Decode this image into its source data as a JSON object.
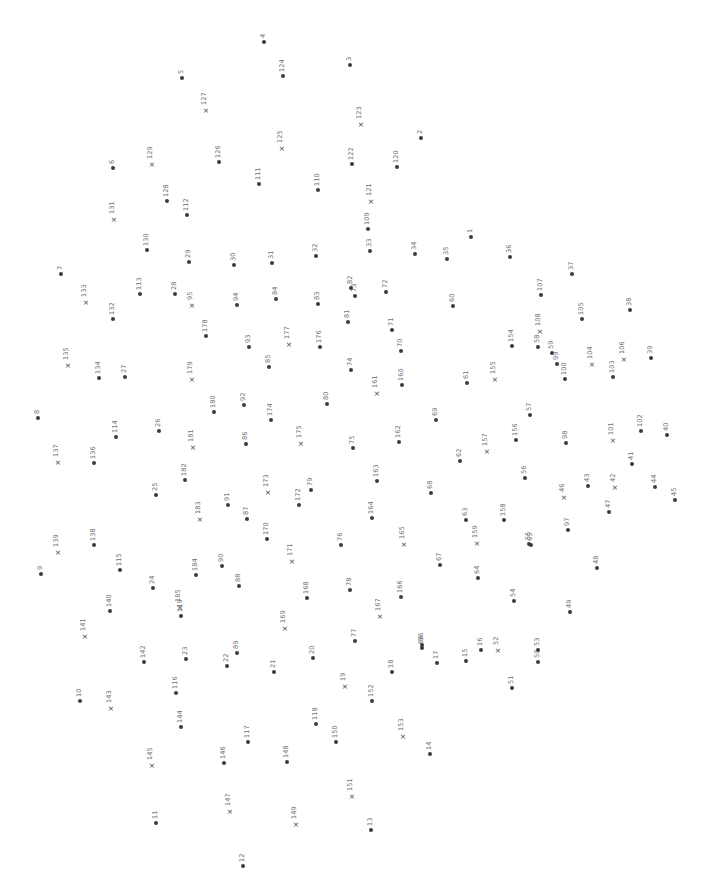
{
  "meta": {
    "width": 719,
    "height": 884,
    "background_color": "#ffffff",
    "marker_color": "#3a3a42",
    "label_color": "#6f6f79",
    "label_rotation_deg": -90,
    "dot_marker": "filled-circle",
    "cross_marker": "×"
  },
  "chart_data": {
    "type": "scatter",
    "title": "",
    "xlabel": "",
    "ylabel": "",
    "grid": false,
    "legend": "none",
    "xlim": [
      0,
      719
    ],
    "ylim": [
      0,
      884
    ],
    "marker_kinds": [
      "dot",
      "cross"
    ],
    "point_count": 185,
    "points": [
      {
        "label": "1",
        "x": 471,
        "y": 237,
        "marker": "dot"
      },
      {
        "label": "2",
        "x": 421,
        "y": 138,
        "marker": "dot"
      },
      {
        "label": "3",
        "x": 350,
        "y": 65,
        "marker": "dot"
      },
      {
        "label": "4",
        "x": 264,
        "y": 42,
        "marker": "dot"
      },
      {
        "label": "5",
        "x": 182,
        "y": 78,
        "marker": "dot"
      },
      {
        "label": "6",
        "x": 113,
        "y": 168,
        "marker": "dot"
      },
      {
        "label": "7",
        "x": 61,
        "y": 274,
        "marker": "dot"
      },
      {
        "label": "8",
        "x": 38,
        "y": 418,
        "marker": "dot"
      },
      {
        "label": "9",
        "x": 41,
        "y": 574,
        "marker": "dot"
      },
      {
        "label": "10",
        "x": 80,
        "y": 701,
        "marker": "dot"
      },
      {
        "label": "11",
        "x": 156,
        "y": 823,
        "marker": "dot"
      },
      {
        "label": "12",
        "x": 243,
        "y": 866,
        "marker": "dot"
      },
      {
        "label": "13",
        "x": 371,
        "y": 830,
        "marker": "dot"
      },
      {
        "label": "14",
        "x": 430,
        "y": 754,
        "marker": "dot"
      },
      {
        "label": "15",
        "x": 466,
        "y": 661,
        "marker": "dot"
      },
      {
        "label": "16",
        "x": 481,
        "y": 650,
        "marker": "dot"
      },
      {
        "label": "17",
        "x": 437,
        "y": 663,
        "marker": "dot"
      },
      {
        "label": "18",
        "x": 392,
        "y": 672,
        "marker": "dot"
      },
      {
        "label": "19",
        "x": 345,
        "y": 686,
        "marker": "cross"
      },
      {
        "label": "20",
        "x": 313,
        "y": 658,
        "marker": "dot"
      },
      {
        "label": "21",
        "x": 274,
        "y": 672,
        "marker": "dot"
      },
      {
        "label": "22",
        "x": 227,
        "y": 666,
        "marker": "dot"
      },
      {
        "label": "23",
        "x": 186,
        "y": 659,
        "marker": "dot"
      },
      {
        "label": "24",
        "x": 153,
        "y": 588,
        "marker": "dot"
      },
      {
        "label": "25",
        "x": 156,
        "y": 495,
        "marker": "dot"
      },
      {
        "label": "26",
        "x": 159,
        "y": 431,
        "marker": "dot"
      },
      {
        "label": "27",
        "x": 125,
        "y": 377,
        "marker": "dot"
      },
      {
        "label": "28",
        "x": 175,
        "y": 294,
        "marker": "dot"
      },
      {
        "label": "29",
        "x": 189,
        "y": 262,
        "marker": "dot"
      },
      {
        "label": "30",
        "x": 234,
        "y": 265,
        "marker": "dot"
      },
      {
        "label": "31",
        "x": 272,
        "y": 263,
        "marker": "dot"
      },
      {
        "label": "32",
        "x": 316,
        "y": 256,
        "marker": "dot"
      },
      {
        "label": "33",
        "x": 370,
        "y": 251,
        "marker": "dot"
      },
      {
        "label": "34",
        "x": 415,
        "y": 254,
        "marker": "dot"
      },
      {
        "label": "35",
        "x": 447,
        "y": 259,
        "marker": "dot"
      },
      {
        "label": "36",
        "x": 510,
        "y": 257,
        "marker": "dot"
      },
      {
        "label": "37",
        "x": 572,
        "y": 274,
        "marker": "dot"
      },
      {
        "label": "38",
        "x": 630,
        "y": 310,
        "marker": "dot"
      },
      {
        "label": "39",
        "x": 651,
        "y": 358,
        "marker": "dot"
      },
      {
        "label": "40",
        "x": 667,
        "y": 435,
        "marker": "dot"
      },
      {
        "label": "41",
        "x": 632,
        "y": 464,
        "marker": "dot"
      },
      {
        "label": "42",
        "x": 615,
        "y": 487,
        "marker": "cross"
      },
      {
        "label": "43",
        "x": 588,
        "y": 486,
        "marker": "dot"
      },
      {
        "label": "44",
        "x": 655,
        "y": 487,
        "marker": "dot"
      },
      {
        "label": "45",
        "x": 675,
        "y": 500,
        "marker": "dot"
      },
      {
        "label": "46",
        "x": 564,
        "y": 497,
        "marker": "cross"
      },
      {
        "label": "47",
        "x": 609,
        "y": 512,
        "marker": "dot"
      },
      {
        "label": "48",
        "x": 597,
        "y": 568,
        "marker": "dot"
      },
      {
        "label": "49",
        "x": 570,
        "y": 612,
        "marker": "dot"
      },
      {
        "label": "50",
        "x": 538,
        "y": 662,
        "marker": "dot"
      },
      {
        "label": "51",
        "x": 512,
        "y": 688,
        "marker": "dot"
      },
      {
        "label": "52",
        "x": 498,
        "y": 650,
        "marker": "cross"
      },
      {
        "label": "53",
        "x": 538,
        "y": 650,
        "marker": "dot"
      },
      {
        "label": "54",
        "x": 514,
        "y": 601,
        "marker": "dot"
      },
      {
        "label": "55",
        "x": 529,
        "y": 544,
        "marker": "dot"
      },
      {
        "label": "56",
        "x": 525,
        "y": 478,
        "marker": "dot"
      },
      {
        "label": "57",
        "x": 530,
        "y": 415,
        "marker": "dot"
      },
      {
        "label": "58",
        "x": 538,
        "y": 347,
        "marker": "dot"
      },
      {
        "label": "59",
        "x": 552,
        "y": 353,
        "marker": "dot"
      },
      {
        "label": "60",
        "x": 453,
        "y": 306,
        "marker": "dot"
      },
      {
        "label": "61",
        "x": 467,
        "y": 383,
        "marker": "dot"
      },
      {
        "label": "62",
        "x": 460,
        "y": 461,
        "marker": "dot"
      },
      {
        "label": "63",
        "x": 466,
        "y": 520,
        "marker": "dot"
      },
      {
        "label": "64",
        "x": 478,
        "y": 578,
        "marker": "dot"
      },
      {
        "label": "65",
        "x": 531,
        "y": 545,
        "marker": "dot"
      },
      {
        "label": "66",
        "x": 422,
        "y": 648,
        "marker": "dot"
      },
      {
        "label": "67",
        "x": 440,
        "y": 565,
        "marker": "dot"
      },
      {
        "label": "68",
        "x": 431,
        "y": 493,
        "marker": "dot"
      },
      {
        "label": "69",
        "x": 436,
        "y": 420,
        "marker": "dot"
      },
      {
        "label": "70",
        "x": 401,
        "y": 351,
        "marker": "dot"
      },
      {
        "label": "71",
        "x": 392,
        "y": 330,
        "marker": "dot"
      },
      {
        "label": "72",
        "x": 386,
        "y": 292,
        "marker": "dot"
      },
      {
        "label": "73",
        "x": 355,
        "y": 296,
        "marker": "dot"
      },
      {
        "label": "74",
        "x": 351,
        "y": 370,
        "marker": "dot"
      },
      {
        "label": "75",
        "x": 353,
        "y": 448,
        "marker": "dot"
      },
      {
        "label": "76",
        "x": 341,
        "y": 545,
        "marker": "dot"
      },
      {
        "label": "77",
        "x": 355,
        "y": 641,
        "marker": "dot"
      },
      {
        "label": "78",
        "x": 350,
        "y": 590,
        "marker": "dot"
      },
      {
        "label": "79",
        "x": 311,
        "y": 490,
        "marker": "dot"
      },
      {
        "label": "80",
        "x": 327,
        "y": 404,
        "marker": "dot"
      },
      {
        "label": "81",
        "x": 348,
        "y": 322,
        "marker": "dot"
      },
      {
        "label": "82",
        "x": 351,
        "y": 288,
        "marker": "dot"
      },
      {
        "label": "83",
        "x": 318,
        "y": 304,
        "marker": "dot"
      },
      {
        "label": "84",
        "x": 276,
        "y": 299,
        "marker": "dot"
      },
      {
        "label": "85",
        "x": 269,
        "y": 367,
        "marker": "dot"
      },
      {
        "label": "86",
        "x": 246,
        "y": 444,
        "marker": "dot"
      },
      {
        "label": "87",
        "x": 247,
        "y": 519,
        "marker": "dot"
      },
      {
        "label": "88",
        "x": 239,
        "y": 586,
        "marker": "dot"
      },
      {
        "label": "89",
        "x": 237,
        "y": 653,
        "marker": "dot"
      },
      {
        "label": "90",
        "x": 222,
        "y": 566,
        "marker": "dot"
      },
      {
        "label": "91",
        "x": 228,
        "y": 505,
        "marker": "dot"
      },
      {
        "label": "92",
        "x": 244,
        "y": 405,
        "marker": "dot"
      },
      {
        "label": "93",
        "x": 249,
        "y": 347,
        "marker": "dot"
      },
      {
        "label": "94",
        "x": 237,
        "y": 305,
        "marker": "dot"
      },
      {
        "label": "95",
        "x": 192,
        "y": 305,
        "marker": "cross"
      },
      {
        "label": "96",
        "x": 422,
        "y": 645,
        "marker": "dot"
      },
      {
        "label": "97",
        "x": 568,
        "y": 530,
        "marker": "dot"
      },
      {
        "label": "98",
        "x": 566,
        "y": 443,
        "marker": "dot"
      },
      {
        "label": "99",
        "x": 557,
        "y": 364,
        "marker": "dot"
      },
      {
        "label": "100",
        "x": 565,
        "y": 379,
        "marker": "dot"
      },
      {
        "label": "101",
        "x": 613,
        "y": 440,
        "marker": "cross"
      },
      {
        "label": "102",
        "x": 641,
        "y": 431,
        "marker": "dot"
      },
      {
        "label": "103",
        "x": 613,
        "y": 377,
        "marker": "dot"
      },
      {
        "label": "104",
        "x": 592,
        "y": 364,
        "marker": "cross"
      },
      {
        "label": "105",
        "x": 582,
        "y": 319,
        "marker": "dot"
      },
      {
        "label": "106",
        "x": 624,
        "y": 359,
        "marker": "cross"
      },
      {
        "label": "107",
        "x": 541,
        "y": 295,
        "marker": "dot"
      },
      {
        "label": "108",
        "x": 540,
        "y": 331,
        "marker": "cross"
      },
      {
        "label": "109",
        "x": 368,
        "y": 229,
        "marker": "dot"
      },
      {
        "label": "110",
        "x": 318,
        "y": 190,
        "marker": "dot"
      },
      {
        "label": "111",
        "x": 259,
        "y": 184,
        "marker": "dot"
      },
      {
        "label": "112",
        "x": 187,
        "y": 215,
        "marker": "dot"
      },
      {
        "label": "113",
        "x": 140,
        "y": 294,
        "marker": "dot"
      },
      {
        "label": "114",
        "x": 116,
        "y": 437,
        "marker": "dot"
      },
      {
        "label": "115",
        "x": 120,
        "y": 570,
        "marker": "dot"
      },
      {
        "label": "116",
        "x": 176,
        "y": 693,
        "marker": "dot"
      },
      {
        "label": "117",
        "x": 248,
        "y": 742,
        "marker": "dot"
      },
      {
        "label": "118",
        "x": 316,
        "y": 724,
        "marker": "dot"
      },
      {
        "label": "119",
        "x": 181,
        "y": 616,
        "marker": "dot"
      },
      {
        "label": "120",
        "x": 397,
        "y": 167,
        "marker": "dot"
      },
      {
        "label": "121",
        "x": 371,
        "y": 201,
        "marker": "cross"
      },
      {
        "label": "122",
        "x": 352,
        "y": 164,
        "marker": "dot"
      },
      {
        "label": "123",
        "x": 361,
        "y": 124,
        "marker": "cross"
      },
      {
        "label": "124",
        "x": 283,
        "y": 76,
        "marker": "dot"
      },
      {
        "label": "125",
        "x": 282,
        "y": 148,
        "marker": "cross"
      },
      {
        "label": "126",
        "x": 219,
        "y": 162,
        "marker": "dot"
      },
      {
        "label": "127",
        "x": 206,
        "y": 110,
        "marker": "cross"
      },
      {
        "label": "128",
        "x": 167,
        "y": 201,
        "marker": "dot"
      },
      {
        "label": "129",
        "x": 152,
        "y": 164,
        "marker": "cross"
      },
      {
        "label": "130",
        "x": 147,
        "y": 250,
        "marker": "dot"
      },
      {
        "label": "131",
        "x": 114,
        "y": 219,
        "marker": "cross"
      },
      {
        "label": "132",
        "x": 113,
        "y": 319,
        "marker": "dot"
      },
      {
        "label": "133",
        "x": 86,
        "y": 302,
        "marker": "cross"
      },
      {
        "label": "134",
        "x": 99,
        "y": 378,
        "marker": "dot"
      },
      {
        "label": "135",
        "x": 68,
        "y": 365,
        "marker": "cross"
      },
      {
        "label": "136",
        "x": 94,
        "y": 463,
        "marker": "dot"
      },
      {
        "label": "137",
        "x": 58,
        "y": 462,
        "marker": "cross"
      },
      {
        "label": "138",
        "x": 94,
        "y": 545,
        "marker": "dot"
      },
      {
        "label": "139",
        "x": 58,
        "y": 552,
        "marker": "cross"
      },
      {
        "label": "140",
        "x": 110,
        "y": 611,
        "marker": "dot"
      },
      {
        "label": "141",
        "x": 85,
        "y": 636,
        "marker": "cross"
      },
      {
        "label": "142",
        "x": 144,
        "y": 662,
        "marker": "dot"
      },
      {
        "label": "143",
        "x": 111,
        "y": 708,
        "marker": "cross"
      },
      {
        "label": "144",
        "x": 181,
        "y": 727,
        "marker": "dot"
      },
      {
        "label": "145",
        "x": 152,
        "y": 765,
        "marker": "cross"
      },
      {
        "label": "146",
        "x": 224,
        "y": 763,
        "marker": "dot"
      },
      {
        "label": "147",
        "x": 230,
        "y": 811,
        "marker": "cross"
      },
      {
        "label": "148",
        "x": 287,
        "y": 762,
        "marker": "dot"
      },
      {
        "label": "149",
        "x": 296,
        "y": 824,
        "marker": "cross"
      },
      {
        "label": "150",
        "x": 336,
        "y": 742,
        "marker": "dot"
      },
      {
        "label": "151",
        "x": 352,
        "y": 796,
        "marker": "cross"
      },
      {
        "label": "152",
        "x": 372,
        "y": 701,
        "marker": "dot"
      },
      {
        "label": "153",
        "x": 403,
        "y": 736,
        "marker": "cross"
      },
      {
        "label": "154",
        "x": 512,
        "y": 346,
        "marker": "dot"
      },
      {
        "label": "155",
        "x": 495,
        "y": 379,
        "marker": "cross"
      },
      {
        "label": "156",
        "x": 516,
        "y": 440,
        "marker": "dot"
      },
      {
        "label": "157",
        "x": 487,
        "y": 451,
        "marker": "cross"
      },
      {
        "label": "158",
        "x": 504,
        "y": 520,
        "marker": "dot"
      },
      {
        "label": "159",
        "x": 477,
        "y": 543,
        "marker": "cross"
      },
      {
        "label": "160",
        "x": 402,
        "y": 385,
        "marker": "dot"
      },
      {
        "label": "161",
        "x": 377,
        "y": 393,
        "marker": "cross"
      },
      {
        "label": "162",
        "x": 399,
        "y": 442,
        "marker": "dot"
      },
      {
        "label": "163",
        "x": 377,
        "y": 481,
        "marker": "dot"
      },
      {
        "label": "164",
        "x": 372,
        "y": 518,
        "marker": "dot"
      },
      {
        "label": "165",
        "x": 404,
        "y": 544,
        "marker": "cross"
      },
      {
        "label": "166",
        "x": 401,
        "y": 597,
        "marker": "dot"
      },
      {
        "label": "167",
        "x": 380,
        "y": 616,
        "marker": "cross"
      },
      {
        "label": "168",
        "x": 307,
        "y": 598,
        "marker": "dot"
      },
      {
        "label": "169",
        "x": 285,
        "y": 628,
        "marker": "cross"
      },
      {
        "label": "170",
        "x": 267,
        "y": 539,
        "marker": "dot"
      },
      {
        "label": "171",
        "x": 292,
        "y": 561,
        "marker": "cross"
      },
      {
        "label": "172",
        "x": 299,
        "y": 505,
        "marker": "dot"
      },
      {
        "label": "173",
        "x": 268,
        "y": 492,
        "marker": "cross"
      },
      {
        "label": "174",
        "x": 271,
        "y": 420,
        "marker": "dot"
      },
      {
        "label": "175",
        "x": 301,
        "y": 443,
        "marker": "cross"
      },
      {
        "label": "176",
        "x": 320,
        "y": 347,
        "marker": "dot"
      },
      {
        "label": "177",
        "x": 289,
        "y": 344,
        "marker": "cross"
      },
      {
        "label": "178",
        "x": 206,
        "y": 336,
        "marker": "dot"
      },
      {
        "label": "179",
        "x": 192,
        "y": 379,
        "marker": "cross"
      },
      {
        "label": "180",
        "x": 214,
        "y": 412,
        "marker": "dot"
      },
      {
        "label": "181",
        "x": 193,
        "y": 447,
        "marker": "cross"
      },
      {
        "label": "182",
        "x": 185,
        "y": 480,
        "marker": "dot"
      },
      {
        "label": "183",
        "x": 200,
        "y": 519,
        "marker": "cross"
      },
      {
        "label": "184",
        "x": 196,
        "y": 575,
        "marker": "dot"
      },
      {
        "label": "185",
        "x": 180,
        "y": 607,
        "marker": "cross"
      }
    ]
  }
}
